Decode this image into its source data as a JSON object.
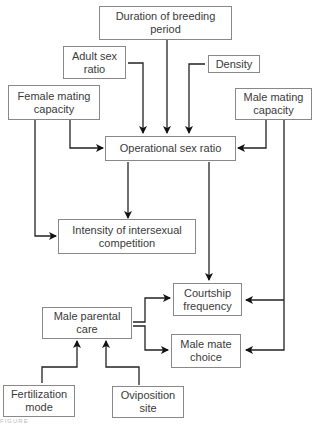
{
  "nodes": {
    "duration": "Duration of breeding period",
    "adult_sex_ratio": "Adult sex ratio",
    "density": "Density",
    "female_mating_capacity": "Female mating capacity",
    "male_mating_capacity": "Male mating capacity",
    "operational_sex_ratio": "Operational sex ratio",
    "intensity": "Intensity of intersexual competition",
    "courtship_frequency": "Courtship frequency",
    "male_parental_care": "Male parental care",
    "male_mate_choice": "Male mate choice",
    "fertilization_mode": "Fertilization mode",
    "oviposition_site": "Oviposition site"
  },
  "edges": [
    {
      "from": "duration",
      "to": "operational_sex_ratio"
    },
    {
      "from": "adult_sex_ratio",
      "to": "operational_sex_ratio"
    },
    {
      "from": "density",
      "to": "operational_sex_ratio"
    },
    {
      "from": "female_mating_capacity",
      "to": "operational_sex_ratio"
    },
    {
      "from": "female_mating_capacity",
      "to": "intensity"
    },
    {
      "from": "male_mating_capacity",
      "to": "operational_sex_ratio"
    },
    {
      "from": "male_mating_capacity",
      "to": "courtship_frequency"
    },
    {
      "from": "male_mating_capacity",
      "to": "male_mate_choice"
    },
    {
      "from": "operational_sex_ratio",
      "to": "intensity"
    },
    {
      "from": "operational_sex_ratio",
      "to": "courtship_frequency"
    },
    {
      "from": "male_parental_care",
      "to": "courtship_frequency"
    },
    {
      "from": "male_parental_care",
      "to": "male_mate_choice"
    },
    {
      "from": "fertilization_mode",
      "to": "male_parental_care"
    },
    {
      "from": "oviposition_site",
      "to": "male_parental_care"
    }
  ],
  "caption": "FIGURE"
}
